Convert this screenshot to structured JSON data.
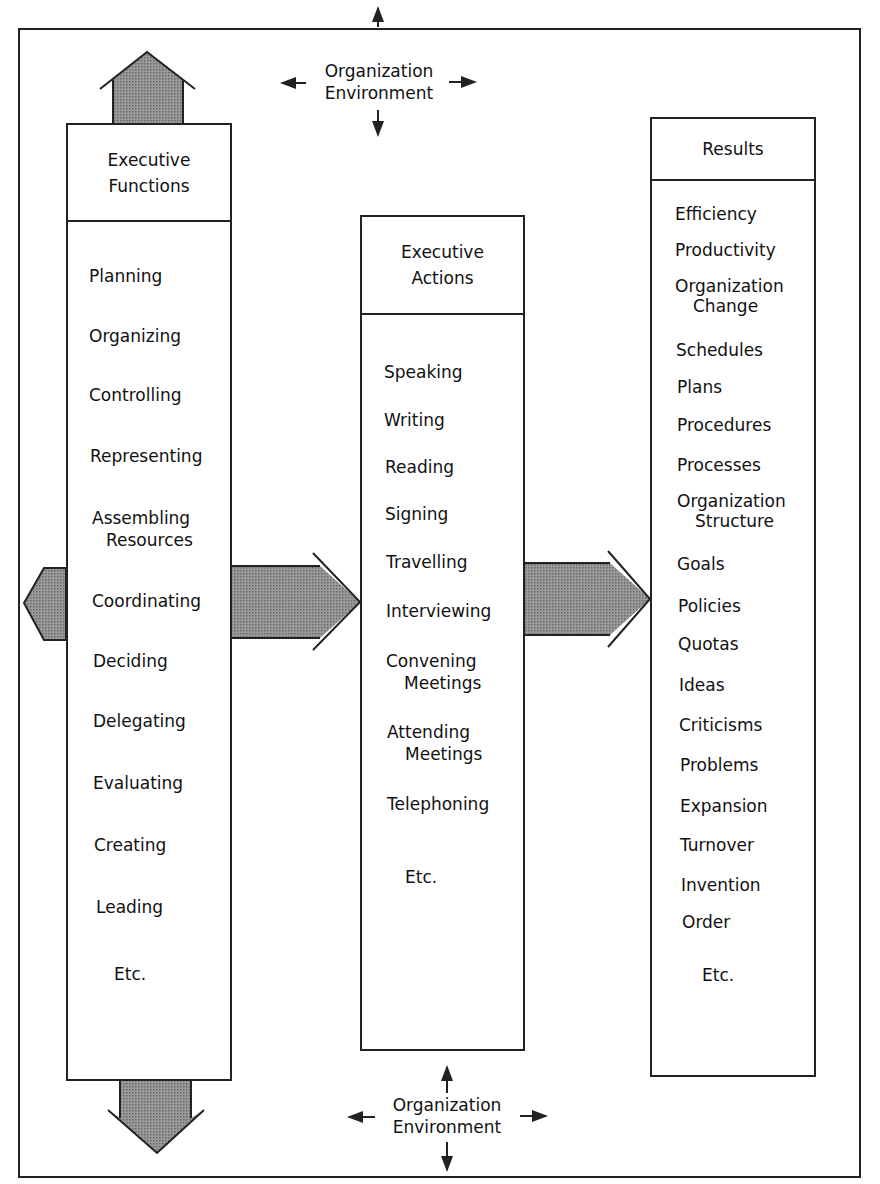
{
  "environment_top": {
    "line1": "Organization",
    "line2": "Environment"
  },
  "environment_bottom": {
    "line1": "Organization",
    "line2": "Environment"
  },
  "executive_functions": {
    "title_line1": "Executive",
    "title_line2": "Functions",
    "items": [
      {
        "line1": "Planning"
      },
      {
        "line1": "Organizing"
      },
      {
        "line1": "Controlling"
      },
      {
        "line1": "Representing"
      },
      {
        "line1": "Assembling",
        "line2": "Resources"
      },
      {
        "line1": "Coordinating"
      },
      {
        "line1": "Deciding"
      },
      {
        "line1": "Delegating"
      },
      {
        "line1": "Evaluating"
      },
      {
        "line1": "Creating"
      },
      {
        "line1": "Leading"
      },
      {
        "line1": "Etc."
      }
    ]
  },
  "executive_actions": {
    "title_line1": "Executive",
    "title_line2": "Actions",
    "items": [
      {
        "line1": "Speaking"
      },
      {
        "line1": "Writing"
      },
      {
        "line1": "Reading"
      },
      {
        "line1": "Signing"
      },
      {
        "line1": "Travelling"
      },
      {
        "line1": "Interviewing"
      },
      {
        "line1": "Convening",
        "line2": "Meetings"
      },
      {
        "line1": "Attending",
        "line2": "Meetings"
      },
      {
        "line1": "Telephoning"
      },
      {
        "line1": "Etc."
      }
    ]
  },
  "results": {
    "title": "Results",
    "items": [
      {
        "line1": "Efficiency"
      },
      {
        "line1": "Productivity"
      },
      {
        "line1": "Organization",
        "line2": "Change"
      },
      {
        "line1": "Schedules"
      },
      {
        "line1": "Plans"
      },
      {
        "line1": "Procedures"
      },
      {
        "line1": "Processes"
      },
      {
        "line1": "Organization",
        "line2": "Structure"
      },
      {
        "line1": "Goals"
      },
      {
        "line1": "Policies"
      },
      {
        "line1": "Quotas"
      },
      {
        "line1": "Ideas"
      },
      {
        "line1": "Criticisms"
      },
      {
        "line1": "Problems"
      },
      {
        "line1": "Expansion"
      },
      {
        "line1": "Turnover"
      },
      {
        "line1": "Invention"
      },
      {
        "line1": "Order"
      },
      {
        "line1": "Etc."
      }
    ]
  },
  "colors": {
    "arrow_fill": "#8a8a8a",
    "line": "#222222"
  }
}
